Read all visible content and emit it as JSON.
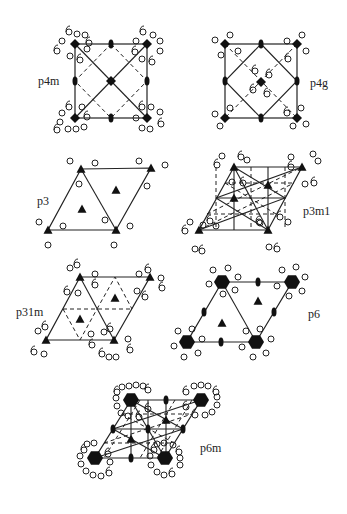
{
  "figure": {
    "title": "",
    "panels": [
      {
        "id": "p4m",
        "label": "p4m",
        "lattice": "square",
        "label_pos": [
          38,
          75
        ]
      },
      {
        "id": "p4g",
        "label": "p4g",
        "lattice": "square",
        "label_pos": [
          310,
          77
        ]
      },
      {
        "id": "p3",
        "label": "p3",
        "lattice": "hexagonal",
        "label_pos": [
          37,
          195
        ]
      },
      {
        "id": "p3m1",
        "label": "p3m1",
        "lattice": "hexagonal",
        "label_pos": [
          303,
          205
        ]
      },
      {
        "id": "p31m",
        "label": "p31m",
        "lattice": "hexagonal",
        "label_pos": [
          16,
          306
        ]
      },
      {
        "id": "p6",
        "label": "p6",
        "lattice": "hexagonal",
        "label_pos": [
          308,
          308
        ]
      },
      {
        "id": "p6m",
        "label": "p6m",
        "lattice": "hexagonal",
        "label_pos": [
          200,
          442
        ]
      }
    ],
    "legend": {
      "diamond": "4-fold rotation axis",
      "triangle": "3-fold rotation axis",
      "ellipse": "2-fold rotation axis",
      "hexagon": "6-fold rotation axis",
      "solid-line": "mirror line",
      "dashed-line": "glide line",
      "circle": "motif"
    },
    "colors": {
      "ink": "#222222",
      "background": "#ffffff"
    }
  }
}
